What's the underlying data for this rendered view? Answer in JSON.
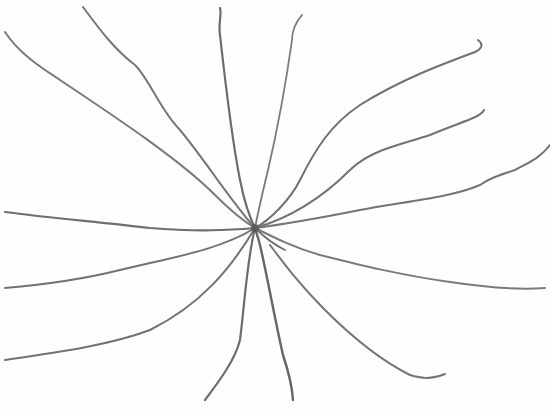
{
  "drawing": {
    "subject": "pencil sketch of lines radiating from a central point",
    "background": "#fefefe",
    "stroke_color": "#6e6e6e",
    "center": [
      255,
      228
    ],
    "strokes": [
      {
        "name": "ray-upper-left-far",
        "d": "M5,32 C20,55 45,70 60,80 C120,120 180,160 215,195 C232,212 245,222 255,228",
        "w": 2.0,
        "c": "#7a7a7a"
      },
      {
        "name": "ray-upper-left",
        "d": "M83,7 C100,30 115,50 135,65 C150,80 160,110 180,130 C205,160 230,200 255,228",
        "w": 2.0,
        "c": "#777777"
      },
      {
        "name": "ray-up",
        "d": "M220,8 C222,15 218,25 220,35 C225,80 232,140 240,180 C245,205 250,218 255,228",
        "w": 2.2,
        "c": "#6c6c6c"
      },
      {
        "name": "ray-up-right",
        "d": "M302,15 C296,22 292,30 292,40 C285,90 275,140 268,170 C262,195 258,212 255,228",
        "w": 1.8,
        "c": "#7a7a7a"
      },
      {
        "name": "ray-upper-right-hook",
        "d": "M478,40 C485,45 480,50 475,52 C440,65 400,80 360,105 C330,125 315,150 300,180 C290,200 270,220 255,228",
        "w": 2.0,
        "c": "#707070"
      },
      {
        "name": "ray-right-upper",
        "d": "M484,110 C480,118 460,122 430,135 C400,145 370,150 350,170 C330,190 300,215 255,228",
        "w": 2.0,
        "c": "#727272"
      },
      {
        "name": "ray-right-far",
        "d": "M550,145 C540,158 530,162 515,170 C500,175 490,178 480,185 C450,198 400,202 360,210 C320,218 285,224 255,228",
        "w": 2.0,
        "c": "#747474"
      },
      {
        "name": "ray-left",
        "d": "M5,212 C50,218 100,222 150,228 C200,232 230,230 255,228",
        "w": 2.2,
        "c": "#6e6e6e"
      },
      {
        "name": "ray-left-lower",
        "d": "M5,288 C40,285 80,280 120,270 C170,258 220,250 255,228",
        "w": 2.0,
        "c": "#727272"
      },
      {
        "name": "ray-lower-left",
        "d": "M5,360 C60,352 110,345 150,330 C200,305 230,270 255,228",
        "w": 2.0,
        "c": "#727272"
      },
      {
        "name": "ray-down-left",
        "d": "M205,400 C220,380 235,360 240,340 C245,300 247,260 255,228",
        "w": 2.2,
        "c": "#6c6c6c"
      },
      {
        "name": "ray-down",
        "d": "M293,400 C292,385 288,370 283,355 C275,320 268,280 260,245 C258,237 256,232 255,228",
        "w": 2.4,
        "c": "#666666"
      },
      {
        "name": "ray-lower-right-hook",
        "d": "M445,374 C430,380 420,378 410,375 C380,360 350,335 325,310 C300,285 285,265 270,245",
        "w": 2.0,
        "c": "#757575"
      },
      {
        "name": "ray-right-lower",
        "d": "M545,288 C520,290 490,288 450,282 C400,275 360,265 320,255 C295,248 275,238 255,228",
        "w": 2.0,
        "c": "#7a7a7a"
      },
      {
        "name": "ray-lower-stub",
        "d": "M255,228 C265,238 275,245 285,250",
        "w": 1.8,
        "c": "#707070"
      }
    ]
  }
}
